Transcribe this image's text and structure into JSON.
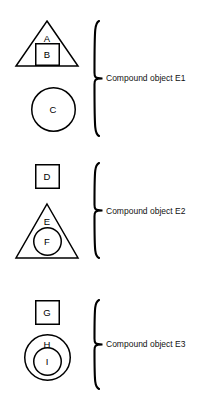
{
  "diagram": {
    "stroke_color": "#000000",
    "background_color": "#ffffff",
    "groups": [
      {
        "label": "Compound object E1",
        "bracket": {
          "x": 92,
          "y": 20,
          "width": 12,
          "height": 117
        },
        "label_pos": {
          "x": 106,
          "y": 74
        },
        "shapes": [
          {
            "kind": "triangle",
            "name": "triangle-a",
            "letter": "A",
            "box": {
              "x": 16,
              "y": 21,
              "width": 62,
              "height": 45
            },
            "letter_pos": {
              "x": 47,
              "y": 39
            }
          },
          {
            "kind": "square",
            "name": "square-b",
            "letter": "B",
            "box": {
              "x": 35,
              "y": 43,
              "width": 25,
              "height": 23
            },
            "letter_pos": {
              "x": 47,
              "y": 55
            }
          },
          {
            "kind": "circle",
            "name": "circle-c",
            "letter": "C",
            "box": {
              "x": 31,
              "y": 87,
              "width": 45,
              "height": 45
            },
            "letter_pos": {
              "x": 53,
              "y": 110
            }
          }
        ]
      },
      {
        "label": "Compound object E2",
        "bracket": {
          "x": 92,
          "y": 162,
          "width": 12,
          "height": 97
        },
        "label_pos": {
          "x": 106,
          "y": 207
        },
        "shapes": [
          {
            "kind": "square",
            "name": "square-d",
            "letter": "D",
            "box": {
              "x": 35,
              "y": 164,
              "width": 25,
              "height": 25
            },
            "letter_pos": {
              "x": 47,
              "y": 177
            }
          },
          {
            "kind": "triangle",
            "name": "triangle-e",
            "letter": "E",
            "box": {
              "x": 16,
              "y": 204,
              "width": 62,
              "height": 54
            },
            "letter_pos": {
              "x": 47,
              "y": 222
            }
          },
          {
            "kind": "circle",
            "name": "circle-f",
            "letter": "F",
            "box": {
              "x": 33,
              "y": 227,
              "width": 29,
              "height": 29
            },
            "letter_pos": {
              "x": 47,
              "y": 242
            }
          }
        ]
      },
      {
        "label": "Compound object E3",
        "bracket": {
          "x": 92,
          "y": 299,
          "width": 12,
          "height": 91
        },
        "label_pos": {
          "x": 106,
          "y": 340
        },
        "shapes": [
          {
            "kind": "square",
            "name": "square-g",
            "letter": "G",
            "box": {
              "x": 35,
              "y": 300,
              "width": 25,
              "height": 25
            },
            "letter_pos": {
              "x": 47,
              "y": 313
            }
          },
          {
            "kind": "circle",
            "name": "circle-h",
            "letter": "H",
            "box": {
              "x": 24,
              "y": 334,
              "width": 47,
              "height": 47
            },
            "letter_pos": {
              "x": 47,
              "y": 345
            }
          },
          {
            "kind": "circle",
            "name": "circle-i",
            "letter": "I",
            "box": {
              "x": 33,
              "y": 347,
              "width": 29,
              "height": 29
            },
            "letter_pos": {
              "x": 47,
              "y": 362
            }
          }
        ]
      }
    ]
  }
}
